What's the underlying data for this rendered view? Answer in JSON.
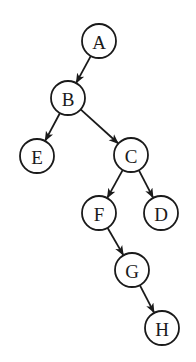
{
  "diagram": {
    "type": "binary-tree",
    "node_radius": 17,
    "stroke_color": "#1a1a1a",
    "fill_color": "#ffffff",
    "background": "#ffffff",
    "nodes": [
      {
        "id": "A",
        "label": "A",
        "x": 99,
        "y": 41
      },
      {
        "id": "B",
        "label": "B",
        "x": 68,
        "y": 98
      },
      {
        "id": "E",
        "label": "E",
        "x": 37,
        "y": 156
      },
      {
        "id": "C",
        "label": "C",
        "x": 131,
        "y": 155
      },
      {
        "id": "F",
        "label": "F",
        "x": 99,
        "y": 213
      },
      {
        "id": "D",
        "label": "D",
        "x": 161,
        "y": 213
      },
      {
        "id": "G",
        "label": "G",
        "x": 132,
        "y": 270
      },
      {
        "id": "H",
        "label": "H",
        "x": 162,
        "y": 328
      }
    ],
    "edges": [
      {
        "from": "A",
        "to": "B",
        "directed": true
      },
      {
        "from": "B",
        "to": "E",
        "directed": true
      },
      {
        "from": "B",
        "to": "C",
        "directed": true
      },
      {
        "from": "C",
        "to": "F",
        "directed": true
      },
      {
        "from": "C",
        "to": "D",
        "directed": true
      },
      {
        "from": "F",
        "to": "G",
        "directed": true
      },
      {
        "from": "G",
        "to": "H",
        "directed": true
      }
    ]
  }
}
